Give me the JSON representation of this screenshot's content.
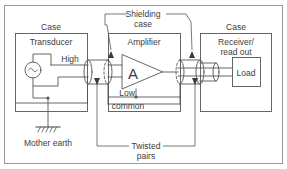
{
  "diagram": {
    "colors": {
      "line": "#555555",
      "text": "#3d3d3d",
      "border": "#9a9a9a",
      "background": "#ffffff"
    },
    "labels": {
      "case_left": "Case",
      "transducer": "Transducer",
      "high": "High",
      "shielding_case_line1": "Shielding",
      "shielding_case_line2": "case",
      "amplifier": "Amplifier",
      "amplifier_symbol": "A",
      "low": "Low",
      "common": "common",
      "case_right": "Case",
      "receiver_line1": "Receiver/",
      "receiver_line2": "read out",
      "load": "Load",
      "twisted_line1": "Twisted",
      "twisted_line2": "pairs",
      "mother_earth": "Mother earth",
      "source_symbol": "∼"
    },
    "blocks": [
      {
        "name": "case-left",
        "label": "Case"
      },
      {
        "name": "transducer",
        "label": "Transducer"
      },
      {
        "name": "amplifier",
        "label": "Amplifier"
      },
      {
        "name": "case-right",
        "label": "Case"
      },
      {
        "name": "receiver",
        "label": "Receiver/ read out"
      },
      {
        "name": "load",
        "label": "Load"
      }
    ],
    "annotations": [
      {
        "name": "shielding-case",
        "label": "Shielding case",
        "targets": 2
      },
      {
        "name": "twisted-pairs",
        "label": "Twisted pairs",
        "targets": 2
      },
      {
        "name": "mother-earth",
        "label": "Mother earth",
        "targets": 1
      }
    ],
    "signals": [
      {
        "name": "high",
        "label": "High"
      },
      {
        "name": "low",
        "label": "Low"
      },
      {
        "name": "common",
        "label": "common"
      }
    ]
  }
}
